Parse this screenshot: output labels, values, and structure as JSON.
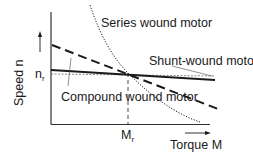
{
  "diagram": {
    "axes": {
      "x_label": "Torque M",
      "y_label": "Speed n",
      "x_marker": {
        "symbol": "M",
        "subscript": "r"
      },
      "y_marker": {
        "symbol": "n",
        "subscript": "r"
      }
    },
    "curves": [
      {
        "id": "series",
        "label": "Series wound motor",
        "style": "dotted",
        "description": "hyperbolic, speed drops strongly with torque"
      },
      {
        "id": "shunt",
        "label": "Shunt-wound motor",
        "style": "solid",
        "description": "nearly constant speed, slight drop"
      },
      {
        "id": "compound",
        "label": "Compound wound motor",
        "style": "dashed",
        "description": "intermediate linear drop"
      }
    ],
    "reference_lines": [
      {
        "id": "rated-speed",
        "style": "dotted",
        "label": "n_r"
      },
      {
        "id": "rated-torque",
        "style": "dashed",
        "label": "M_r"
      }
    ],
    "colors": {
      "line": "#1a1a1a",
      "background": "#ffffff"
    }
  }
}
